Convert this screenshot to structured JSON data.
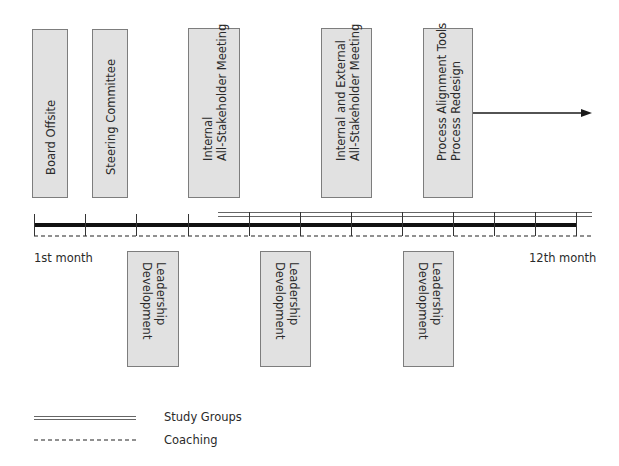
{
  "top_events": [
    {
      "lines": [
        "Board Offsite"
      ]
    },
    {
      "lines": [
        "Steering Committee"
      ]
    },
    {
      "lines": [
        "Internal",
        "All-Stakeholder Meeting"
      ]
    },
    {
      "lines": [
        "Internal and External",
        "All-Stakeholder Meeting"
      ]
    },
    {
      "lines": [
        "Process Alignment Tools",
        "Process Redesign"
      ]
    }
  ],
  "bottom_events": [
    {
      "lines": [
        "Leadership",
        "Development"
      ]
    },
    {
      "lines": [
        "Leadership",
        "Development"
      ]
    },
    {
      "lines": [
        "Leadership",
        "Development"
      ]
    }
  ],
  "timeline": {
    "start_label": "1st month",
    "end_label": "12th month",
    "months": 12
  },
  "legend": {
    "study_groups": "Study Groups",
    "coaching": "Coaching"
  },
  "colors": {
    "box_fill": "#e1e1e1",
    "box_border": "#7d7d7d",
    "line": "#1a1a1a"
  }
}
